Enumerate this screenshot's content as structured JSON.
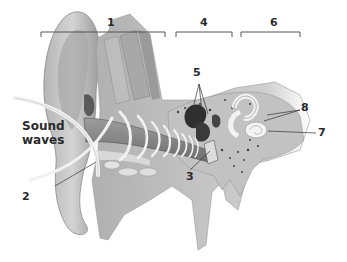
{
  "diagram": {
    "side_label": {
      "line1": "Sound",
      "line2": "waves"
    },
    "brackets": [
      {
        "label": "1",
        "x1": 41,
        "x2": 165
      },
      {
        "label": "4",
        "x1": 176,
        "x2": 232
      },
      {
        "label": "6",
        "x1": 241,
        "x2": 300
      }
    ],
    "callouts": [
      {
        "label": "2"
      },
      {
        "label": "3"
      },
      {
        "label": "5"
      },
      {
        "label": "7"
      },
      {
        "label": "8"
      }
    ],
    "colors": {
      "skin": "#c9c9c9",
      "skin_dark": "#8f8f8f",
      "bone": "#b8b8b8",
      "bone_dots": "#4a4a4a",
      "wave": "#efefef",
      "line": "#3a3a3a",
      "text": "#2a2a2a"
    }
  }
}
